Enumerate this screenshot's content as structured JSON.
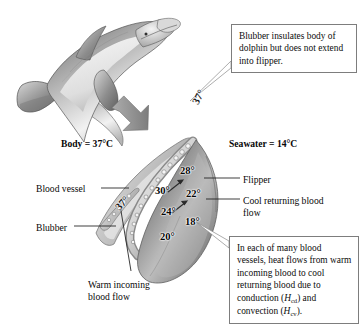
{
  "figure": {
    "background_color": "#ffffff",
    "illustration": {
      "dolphin": "grayscale airbrush illustration of a bottlenose dolphin leaping, facing right",
      "arrow": "thick gray downward-right arrow pointing from dolphin to flipper cross-section",
      "flipper_section": "shaded cutaway of a dolphin flipper showing artery and surrounding veins"
    }
  },
  "callouts": [
    {
      "id": "blubber",
      "text": "Blubber insulates body of dolphin but does not extend into flipper.",
      "points_to": "flipper base"
    },
    {
      "id": "heat_flow",
      "text_part1": "In each of many blood vessels, heat flows from warm incoming blood to cool returning blood due to conduction (",
      "symbol1": "H",
      "sub1": "cd",
      "text_part2": ") and convection (",
      "symbol2": "H",
      "sub2": "cv",
      "text_part3": ").",
      "points_to": "blood vessel interior of flipper"
    }
  ],
  "temperature_labels": {
    "body": "Body = 37°C",
    "seawater": "Seawater = 14°C"
  },
  "labels": {
    "blood_vessel": "Blood vessel",
    "blubber": "Blubber",
    "warm_incoming": "Warm incoming blood flow",
    "flipper": "Flipper",
    "cool_returning": "Cool returning blood flow"
  },
  "chart_data": {
    "type": "diagram",
    "unit": "°C",
    "body_temperature": 37,
    "seawater_temperature": 14,
    "gradient_points": [
      {
        "label": "37°",
        "value": 37,
        "location": "flipper base, incoming artery",
        "x": 190,
        "y": 101,
        "rotated": true
      },
      {
        "label": "37°",
        "value": 37,
        "location": "proximal blood vessel",
        "x": 113,
        "y": 205,
        "rotated": true
      },
      {
        "label": "30°",
        "value": 30,
        "location": "mid incoming artery",
        "x": 155,
        "y": 185
      },
      {
        "label": "28°",
        "value": 28,
        "location": "upper distal vein",
        "x": 180,
        "y": 165
      },
      {
        "label": "24°",
        "value": 24,
        "location": "lower incoming artery",
        "x": 161,
        "y": 206
      },
      {
        "label": "22°",
        "value": 22,
        "location": "mid returning vein",
        "x": 186,
        "y": 188
      },
      {
        "label": "20°",
        "value": 20,
        "location": "flipper tip artery",
        "x": 160,
        "y": 231
      },
      {
        "label": "18°",
        "value": 18,
        "location": "lower returning vein",
        "x": 185,
        "y": 216
      }
    ],
    "flow_arrows": [
      {
        "from": "warm incoming blood",
        "direction": "toward flipper tip"
      },
      {
        "from": "cool returning blood",
        "direction": "toward body"
      }
    ]
  }
}
